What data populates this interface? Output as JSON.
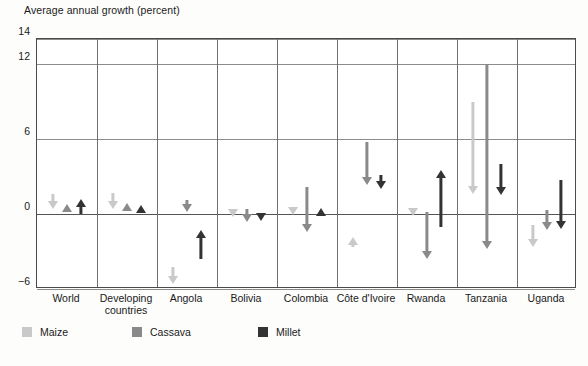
{
  "chart_data": {
    "type": "bar",
    "title": "Average annual growth (percent)",
    "xlabel": "",
    "ylabel": "Average annual growth (percent)",
    "ylim": [
      -6,
      14
    ],
    "yticks": [
      14,
      12,
      6,
      0,
      -6
    ],
    "ytick_labels": [
      "14",
      "12",
      "6",
      "0",
      "−6"
    ],
    "grid": true,
    "legend_position": "below",
    "note": "Each marker is an arrow spanning from a start value to an end value; arrowhead shows direction of change.",
    "categories": [
      "World",
      "Developing countries",
      "Angola",
      "Bolivia",
      "Colombia",
      "Côte d'Ivoire",
      "Rwanda",
      "Tanzania",
      "Uganda"
    ],
    "series": [
      {
        "name": "Maize",
        "color": "#c9c9c9",
        "arrows": [
          {
            "category": "World",
            "start": 1.6,
            "end": 0.4,
            "direction": "down"
          },
          {
            "category": "Developing countries",
            "start": 1.7,
            "end": 0.4,
            "direction": "down"
          },
          {
            "category": "Angola",
            "start": -4.2,
            "end": -5.6,
            "direction": "down"
          },
          {
            "category": "Bolivia",
            "start": 0.4,
            "end": -0.1,
            "direction": "down"
          },
          {
            "category": "Colombia",
            "start": 0.6,
            "end": -0.1,
            "direction": "down"
          },
          {
            "category": "Côte d'Ivoire",
            "start": -1.8,
            "end": -2.6,
            "direction": "up"
          },
          {
            "category": "Rwanda",
            "start": 0.5,
            "end": -0.1,
            "direction": "down"
          },
          {
            "category": "Tanzania",
            "start": 9.0,
            "end": 1.6,
            "direction": "down"
          },
          {
            "category": "Uganda",
            "start": -0.9,
            "end": -2.6,
            "direction": "down"
          }
        ]
      },
      {
        "name": "Cassava",
        "color": "#8a8a8a",
        "arrows": [
          {
            "category": "World",
            "start": 0.8,
            "end": 0.3,
            "direction": "up"
          },
          {
            "category": "Developing countries",
            "start": 0.9,
            "end": 0.4,
            "direction": "up"
          },
          {
            "category": "Angola",
            "start": 1.1,
            "end": 0.2,
            "direction": "down"
          },
          {
            "category": "Bolivia",
            "start": 0.4,
            "end": -0.6,
            "direction": "down"
          },
          {
            "category": "Colombia",
            "start": 2.2,
            "end": -1.4,
            "direction": "down"
          },
          {
            "category": "Côte d'Ivoire",
            "start": 5.8,
            "end": 2.3,
            "direction": "down"
          },
          {
            "category": "Rwanda",
            "start": 0.2,
            "end": -3.6,
            "direction": "down"
          },
          {
            "category": "Tanzania",
            "start": 12.0,
            "end": -2.8,
            "direction": "down"
          },
          {
            "category": "Uganda",
            "start": 0.3,
            "end": -1.3,
            "direction": "down"
          }
        ]
      },
      {
        "name": "Millet",
        "color": "#333333",
        "arrows": [
          {
            "category": "World",
            "start": 0.0,
            "end": 1.2,
            "direction": "up"
          },
          {
            "category": "Developing countries",
            "start": 0.2,
            "end": 0.7,
            "direction": "up"
          },
          {
            "category": "Angola",
            "start": -3.6,
            "end": -1.3,
            "direction": "up"
          },
          {
            "category": "Bolivia",
            "start": 0.1,
            "end": -0.4,
            "direction": "down"
          },
          {
            "category": "Colombia",
            "start": 0.2,
            "end": 0.5,
            "direction": "up"
          },
          {
            "category": "Côte d'Ivoire",
            "start": 3.1,
            "end": 2.0,
            "direction": "down"
          },
          {
            "category": "Rwanda",
            "start": -1.0,
            "end": 3.5,
            "direction": "up"
          },
          {
            "category": "Tanzania",
            "start": 4.0,
            "end": 1.5,
            "direction": "down"
          },
          {
            "category": "Uganda",
            "start": 2.7,
            "end": -1.2,
            "direction": "down"
          }
        ]
      }
    ]
  },
  "legend": {
    "items": [
      {
        "label": "Maize",
        "color": "#c9c9c9"
      },
      {
        "label": "Cassava",
        "color": "#8a8a8a"
      },
      {
        "label": "Millet",
        "color": "#333333"
      }
    ]
  }
}
